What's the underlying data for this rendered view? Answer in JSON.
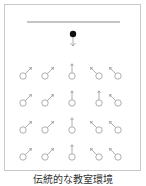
{
  "caption": "伝統的な教室環境",
  "colors": {
    "frame": "#c8c8c8",
    "board": "#8a8a8a",
    "teacher": "#111111",
    "teacher_arrow": "#9a9a9a",
    "student": "#9a9a9a"
  },
  "board": {
    "x1": 27,
    "x2": 120,
    "y": 22
  },
  "teacher": {
    "cx": 73,
    "cy": 34,
    "r": 3.2,
    "arrow_from": 37,
    "arrow_to": 46,
    "icon": "teacher-dot-with-down-arrow"
  },
  "students": {
    "icon": "male-symbol-student",
    "columns_x": [
      23,
      45,
      72,
      99,
      118
    ],
    "rows_y": [
      76,
      103,
      130,
      157
    ],
    "directions": [
      [
        "up-right",
        "up-right",
        "up",
        "up-left",
        "up-left"
      ],
      [
        "up-right",
        "up-right",
        "up",
        "up",
        "up-left"
      ],
      [
        "up-right",
        "up-right",
        "up",
        "up-left",
        "up-left"
      ],
      [
        "up-right",
        "up-right",
        "up",
        "up-left",
        "up-left"
      ]
    ]
  }
}
